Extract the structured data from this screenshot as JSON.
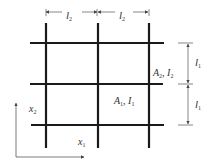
{
  "diagram": {
    "type": "beam-grid",
    "colors": {
      "beam": "#1a1a1a",
      "dim": "#555555",
      "text": "#333333"
    },
    "vertical_beams_x": [
      46,
      98,
      148
    ],
    "horizontal_beams_y": [
      43,
      84,
      124
    ],
    "labels": {
      "top_dim_1": {
        "main": "l",
        "sub": "2"
      },
      "top_dim_2": {
        "main": "l",
        "sub": "2"
      },
      "right_dim_1": {
        "main": "l",
        "sub": "1"
      },
      "right_dim_2": {
        "main": "l",
        "sub": "1"
      },
      "beam2_props": {
        "A": "A",
        "a_sub": "2",
        "sep": ", ",
        "I": "I",
        "i_sub": "2"
      },
      "beam1_props": {
        "A": "A",
        "a_sub": "1",
        "sep": ", ",
        "I": "I",
        "i_sub": "1"
      },
      "axis_x": {
        "main": "x",
        "sub": "1"
      },
      "axis_y": {
        "main": "x",
        "sub": "2"
      }
    }
  }
}
